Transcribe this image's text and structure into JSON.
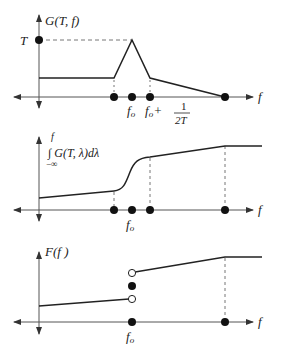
{
  "panels": [
    {
      "id": "top",
      "y_label": "G(T, f)",
      "y_tick_label": "T",
      "x_label": "f",
      "x_tick_labels": [
        "f_o",
        "f_o + 1/(2T)"
      ],
      "tick_label_fo": "f",
      "tick_label_fo_sub": "o",
      "tick_label_plus": "+",
      "frac_num": "1",
      "frac_den": "2T"
    },
    {
      "id": "middle",
      "y_label_upper": "f",
      "y_label_integral": "∫ G(T, λ)dλ",
      "y_label_lower": "−∞",
      "x_label": "f",
      "tick_label_fo": "f",
      "tick_label_fo_sub": "o"
    },
    {
      "id": "bottom",
      "y_label": "F(f )",
      "x_label": "f",
      "tick_label_fo": "f",
      "tick_label_fo_sub": "o"
    }
  ],
  "colors": {
    "line": "#222222",
    "axis": "#555555",
    "dash": "#666666"
  }
}
